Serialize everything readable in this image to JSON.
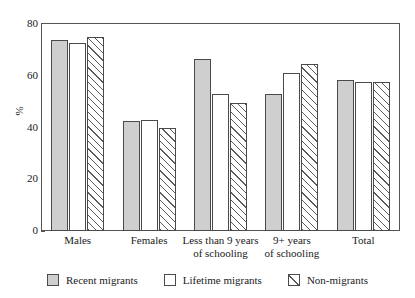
{
  "chart_data": {
    "type": "bar",
    "title": "",
    "xlabel": "",
    "ylabel": "%",
    "ylim": [
      0,
      80
    ],
    "yticks": [
      0,
      20,
      40,
      60,
      80
    ],
    "grid": false,
    "legend_position": "bottom",
    "categories": [
      "Males",
      "Females",
      "Less than 9 years of schooling",
      "9+ years of schooling",
      "Total"
    ],
    "category_lines": [
      [
        "Males"
      ],
      [
        "Females"
      ],
      [
        "Less than 9 years",
        "of schooling"
      ],
      [
        "9+ years",
        "of schooling"
      ],
      [
        "Total"
      ]
    ],
    "series": [
      {
        "name": "Recent migrants",
        "fill": "solid-gray",
        "color": "#cfcfcf",
        "values": [
          74,
          42.5,
          66.5,
          53,
          58.5
        ]
      },
      {
        "name": "Lifetime migrants",
        "fill": "white",
        "color": "#ffffff",
        "values": [
          72.5,
          43,
          53,
          61,
          57.5
        ]
      },
      {
        "name": "Non-migrants",
        "fill": "hatch-45",
        "color": "#ffffff",
        "values": [
          75,
          40,
          49.5,
          64.5,
          57.5
        ]
      }
    ]
  },
  "axis": {
    "y_label": "%",
    "y_ticks": [
      "0",
      "20",
      "40",
      "60",
      "80"
    ]
  },
  "legend": {
    "items": [
      {
        "label": "Recent migrants"
      },
      {
        "label": "Lifetime migrants"
      },
      {
        "label": "Non-migrants"
      }
    ]
  }
}
